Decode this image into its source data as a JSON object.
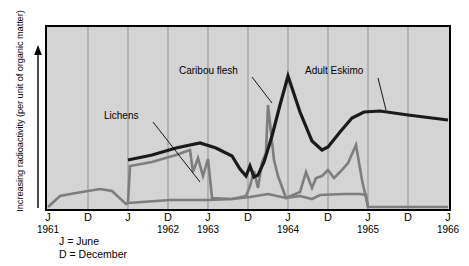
{
  "chart_data": {
    "type": "line",
    "title": "",
    "ylabel": "Increasing radioactivity (per unit of organic matter)",
    "xlabel": "",
    "grid": true,
    "legend_position": "inline-annotations",
    "x_tick_labels": [
      "J",
      "D",
      "J",
      "D",
      "J",
      "D",
      "J",
      "D",
      "J",
      "D",
      "J"
    ],
    "x_year_labels": [
      {
        "label": "1961",
        "tick_index": 0
      },
      {
        "label": "1962",
        "tick_index": 3
      },
      {
        "label": "1963",
        "tick_index": 4
      },
      {
        "label": "1964",
        "tick_index": 6
      },
      {
        "label": "1965",
        "tick_index": 8
      },
      {
        "label": "1966",
        "tick_index": 10
      }
    ],
    "key": [
      "J = June",
      "D = December"
    ],
    "series": [
      {
        "name": "Lichens",
        "color": "#7d7d7d",
        "points": [
          [
            48,
            207
          ],
          [
            60,
            196
          ],
          [
            76,
            193
          ],
          [
            100,
            189
          ],
          [
            112,
            191
          ],
          [
            126,
            204
          ],
          [
            128,
            203
          ],
          [
            130,
            166
          ],
          [
            152,
            162
          ],
          [
            176,
            155
          ],
          [
            190,
            150
          ],
          [
            193,
            172
          ],
          [
            198,
            158
          ],
          [
            203,
            176
          ],
          [
            208,
            159
          ],
          [
            212,
            198
          ],
          [
            232,
            199
          ],
          [
            246,
            196
          ],
          [
            250,
            186
          ],
          [
            254,
            171
          ],
          [
            258,
            188
          ],
          [
            262,
            162
          ],
          [
            266,
            153
          ],
          [
            268,
            105
          ],
          [
            274,
            160
          ],
          [
            278,
            176
          ],
          [
            286,
            198
          ],
          [
            300,
            192
          ],
          [
            306,
            172
          ],
          [
            312,
            188
          ],
          [
            316,
            178
          ],
          [
            322,
            176
          ],
          [
            328,
            170
          ],
          [
            334,
            178
          ],
          [
            340,
            172
          ],
          [
            348,
            163
          ],
          [
            356,
            145
          ],
          [
            362,
            180
          ],
          [
            368,
            207
          ],
          [
            448,
            207
          ]
        ]
      },
      {
        "name": "Lichens-lower",
        "color": "#7d7d7d",
        "points": [
          [
            128,
            203
          ],
          [
            170,
            200
          ],
          [
            210,
            200
          ],
          [
            232,
            199
          ],
          [
            250,
            197
          ],
          [
            268,
            194
          ],
          [
            286,
            198
          ],
          [
            300,
            196
          ],
          [
            312,
            199
          ],
          [
            320,
            195
          ],
          [
            344,
            194
          ],
          [
            360,
            194
          ],
          [
            366,
            195
          ],
          [
            368,
            207
          ]
        ]
      },
      {
        "name": "Caribou flesh",
        "color": "#1a1a1a",
        "points": [
          [
            128,
            160
          ],
          [
            152,
            155
          ],
          [
            176,
            148
          ],
          [
            200,
            143
          ],
          [
            216,
            148
          ],
          [
            232,
            156
          ],
          [
            240,
            169
          ],
          [
            246,
            176
          ],
          [
            250,
            166
          ],
          [
            254,
            177
          ],
          [
            258,
            175
          ],
          [
            264,
            162
          ],
          [
            272,
            136
          ],
          [
            280,
            105
          ],
          [
            288,
            76
          ],
          [
            300,
            112
          ],
          [
            312,
            141
          ],
          [
            322,
            150
          ],
          [
            328,
            147
          ],
          [
            340,
            132
          ],
          [
            352,
            118
          ],
          [
            364,
            112
          ],
          [
            380,
            111
          ],
          [
            408,
            115
          ],
          [
            448,
            120
          ]
        ]
      }
    ],
    "annotations": [
      {
        "text": "Caribou flesh",
        "x": 179,
        "y": 65,
        "leader": [
          [
            252,
            77
          ],
          [
            272,
            103
          ]
        ]
      },
      {
        "text": "Lichens",
        "x": 104,
        "y": 110,
        "leader": [
          [
            153,
            122
          ],
          [
            200,
            182
          ]
        ]
      },
      {
        "text": "Adult Eskimo",
        "x": 305,
        "y": 65,
        "leader": [
          [
            378,
            78
          ],
          [
            386,
            110
          ]
        ]
      }
    ],
    "plot_area": {
      "x": 46,
      "y": 26,
      "width": 404,
      "height": 184
    },
    "gridline_x": [
      88,
      128,
      168,
      208,
      248,
      288,
      328,
      368,
      408
    ],
    "colors": {
      "plot_bg": "#d4d4d4",
      "frame": "#000000",
      "grid": "#8f8f8f"
    }
  }
}
